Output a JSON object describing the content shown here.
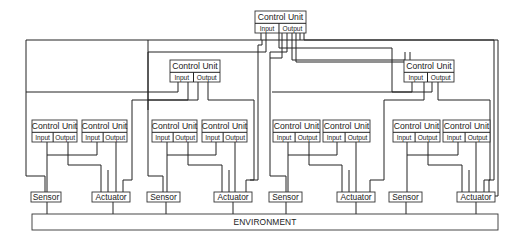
{
  "diagram": {
    "control_unit_label": "Control Unit",
    "input_label": "Input",
    "output_label": "Output",
    "sensor_label": "Sensor",
    "actuator_label": "Actuator",
    "environment_label": "ENVIRONMENT",
    "levels": {
      "top": [
        {
          "id": "cu-top",
          "x": 255,
          "y": 11,
          "w": 51,
          "h": 22
        }
      ],
      "middle": [
        {
          "id": "cu-mid-left",
          "x": 170,
          "y": 60,
          "w": 50,
          "h": 22
        },
        {
          "id": "cu-mid-right",
          "x": 404,
          "y": 60,
          "w": 50,
          "h": 22
        }
      ],
      "bottom": [
        {
          "id": "cu-low-1",
          "x": 32,
          "y": 120,
          "w": 45,
          "h": 22
        },
        {
          "id": "cu-low-2",
          "x": 82,
          "y": 120,
          "w": 45,
          "h": 22
        },
        {
          "id": "cu-low-3",
          "x": 152,
          "y": 120,
          "w": 45,
          "h": 22
        },
        {
          "id": "cu-low-4",
          "x": 202,
          "y": 120,
          "w": 45,
          "h": 22
        },
        {
          "id": "cu-low-5",
          "x": 273,
          "y": 120,
          "w": 47,
          "h": 22
        },
        {
          "id": "cu-low-6",
          "x": 323,
          "y": 120,
          "w": 47,
          "h": 22
        },
        {
          "id": "cu-low-7",
          "x": 393,
          "y": 120,
          "w": 47,
          "h": 22
        },
        {
          "id": "cu-low-8",
          "x": 443,
          "y": 120,
          "w": 47,
          "h": 22
        }
      ]
    },
    "sensors": [
      {
        "id": "sensor-1",
        "x": 31,
        "y": 192,
        "w": 30,
        "h": 10
      },
      {
        "id": "sensor-2",
        "x": 147,
        "y": 192,
        "w": 33,
        "h": 10
      },
      {
        "id": "sensor-3",
        "x": 269,
        "y": 192,
        "w": 33,
        "h": 10
      },
      {
        "id": "sensor-4",
        "x": 389,
        "y": 192,
        "w": 33,
        "h": 10
      }
    ],
    "actuators": [
      {
        "id": "actuator-1",
        "x": 92,
        "y": 192,
        "w": 38,
        "h": 10
      },
      {
        "id": "actuator-2",
        "x": 214,
        "y": 192,
        "w": 38,
        "h": 10
      },
      {
        "id": "actuator-3",
        "x": 337,
        "y": 192,
        "w": 38,
        "h": 10
      },
      {
        "id": "actuator-4",
        "x": 457,
        "y": 192,
        "w": 38,
        "h": 10
      }
    ],
    "environment": {
      "x": 32,
      "y": 214,
      "w": 466,
      "h": 16
    },
    "colors": {
      "line": "#222222",
      "background": "#ffffff"
    }
  }
}
